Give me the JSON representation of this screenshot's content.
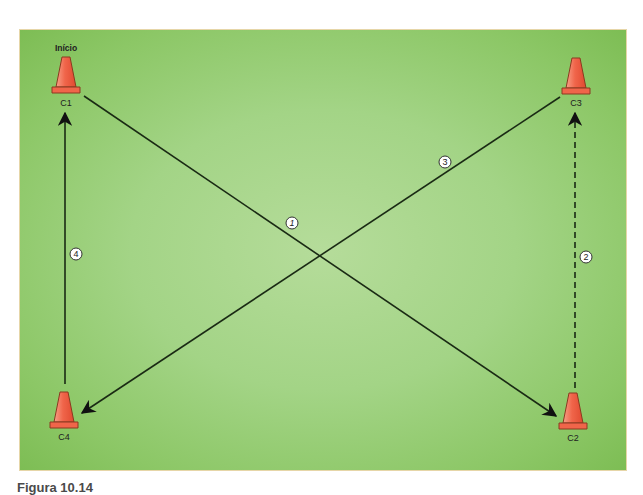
{
  "diagram": {
    "field_color": "#a3d486",
    "start_label": "Início",
    "cones": [
      {
        "id": "C1",
        "label": "C1",
        "x": 66,
        "y": 75
      },
      {
        "id": "C2",
        "label": "C2",
        "x": 573,
        "y": 411
      },
      {
        "id": "C3",
        "label": "C3",
        "x": 576,
        "y": 76
      },
      {
        "id": "C4",
        "label": "C4",
        "x": 64,
        "y": 410
      }
    ],
    "paths": [
      {
        "step": "1",
        "from": "C1",
        "to": "C2",
        "style": "solid"
      },
      {
        "step": "2",
        "from": "C2",
        "to": "C3",
        "style": "dashed"
      },
      {
        "step": "3",
        "from": "C3",
        "to": "C4",
        "style": "solid"
      },
      {
        "step": "4",
        "from": "C4",
        "to": "C1",
        "style": "solid"
      }
    ],
    "step_markers": [
      {
        "label": "1",
        "x": 292,
        "y": 223
      },
      {
        "label": "2",
        "x": 586,
        "y": 257
      },
      {
        "label": "3",
        "x": 445,
        "y": 162
      },
      {
        "label": "4",
        "x": 76,
        "y": 254
      }
    ]
  },
  "caption": "Figura 10.14"
}
